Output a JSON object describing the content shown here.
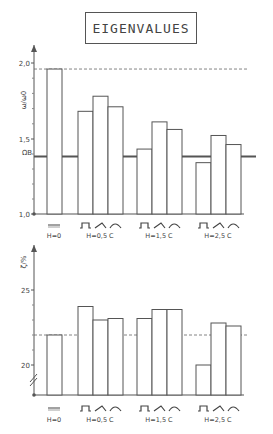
{
  "title": "EIGENVALUES",
  "chart_data": [
    {
      "type": "bar",
      "title": "EIGENVALUES",
      "ylabel": "ω/ω0",
      "yticks": [
        "2,0",
        "1,5",
        "1,0"
      ],
      "ytick_values": [
        2.0,
        1.5,
        1.0
      ],
      "ylim": [
        1.0,
        2.1
      ],
      "reference_lines": [
        {
          "name": "dashed-max",
          "value": 1.96,
          "style": "dashed"
        },
        {
          "name": "ΩB",
          "value": 1.38,
          "style": "solid-thick",
          "label": "ΩB"
        }
      ],
      "groups": [
        {
          "label": "H=0",
          "symbols": "flat",
          "values": [
            1.96
          ]
        },
        {
          "label": "H=0,5 C",
          "symbols": "rect,tri,arc",
          "values": [
            1.68,
            1.78,
            1.71
          ]
        },
        {
          "label": "H=1,5 C",
          "symbols": "rect,tri,arc",
          "values": [
            1.43,
            1.61,
            1.56
          ]
        },
        {
          "label": "H=2,5 C",
          "symbols": "rect,tri,arc",
          "values": [
            1.34,
            1.52,
            1.46
          ]
        }
      ],
      "grid": false
    },
    {
      "type": "bar",
      "ylabel": "ζ/%",
      "yticks": [
        "25",
        "20"
      ],
      "ytick_values": [
        25,
        20
      ],
      "ylim": [
        18.0,
        28.0
      ],
      "axis_break": true,
      "reference_lines": [
        {
          "name": "dashed-ref",
          "value": 24.0,
          "style": "dashed"
        }
      ],
      "groups": [
        {
          "label": "H=0",
          "symbols": "flat",
          "values": [
            24.0
          ]
        },
        {
          "label": "H=0,5 C",
          "symbols": "rect,tri,arc",
          "values": [
            25.9,
            25.0,
            25.1
          ]
        },
        {
          "label": "H=1,5 C",
          "symbols": "rect,tri,arc",
          "values": [
            25.1,
            25.7,
            25.7
          ]
        },
        {
          "label": "H=2,5 C",
          "symbols": "rect,tri,arc",
          "values": [
            22.0,
            24.8,
            24.6
          ]
        }
      ],
      "grid": false
    }
  ]
}
